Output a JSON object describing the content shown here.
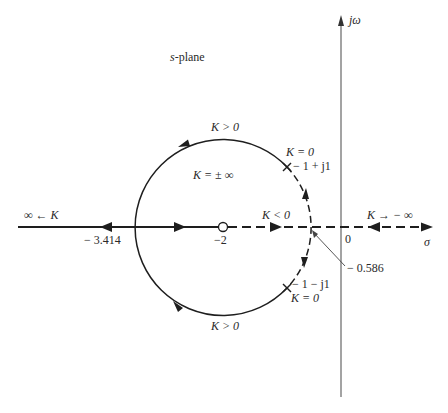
{
  "diagram": {
    "type": "root-locus",
    "plane_label": "s-plane",
    "axes": {
      "real_label": "σ",
      "imag_label": "jω",
      "origin_label": "0"
    },
    "points": {
      "zero": {
        "value": "−2",
        "kind": "zero (o)"
      },
      "pole_upper": {
        "value": "− 1 + j1",
        "gain": "K = 0",
        "kind": "pole (x)"
      },
      "pole_lower": {
        "value": "− 1 − j1",
        "gain": "K = 0",
        "kind": "pole (x)"
      },
      "breakaway_left": {
        "value": "− 3.414"
      },
      "breakaway_right": {
        "value": "− 0.586"
      }
    },
    "labels": {
      "k_pos_top": "K > 0",
      "k_pos_bottom": "K > 0",
      "k_infinity_center": "K = ± ∞",
      "k_neg": "K < 0",
      "k_to_neg_inf": "K → − ∞",
      "inf_left": "∞ ← K",
      "k0_upper": "K = 0",
      "k0_lower": "K = 0"
    },
    "colors": {
      "line": "#1e1e1e",
      "axis": "#555555",
      "background": "#ffffff"
    }
  }
}
